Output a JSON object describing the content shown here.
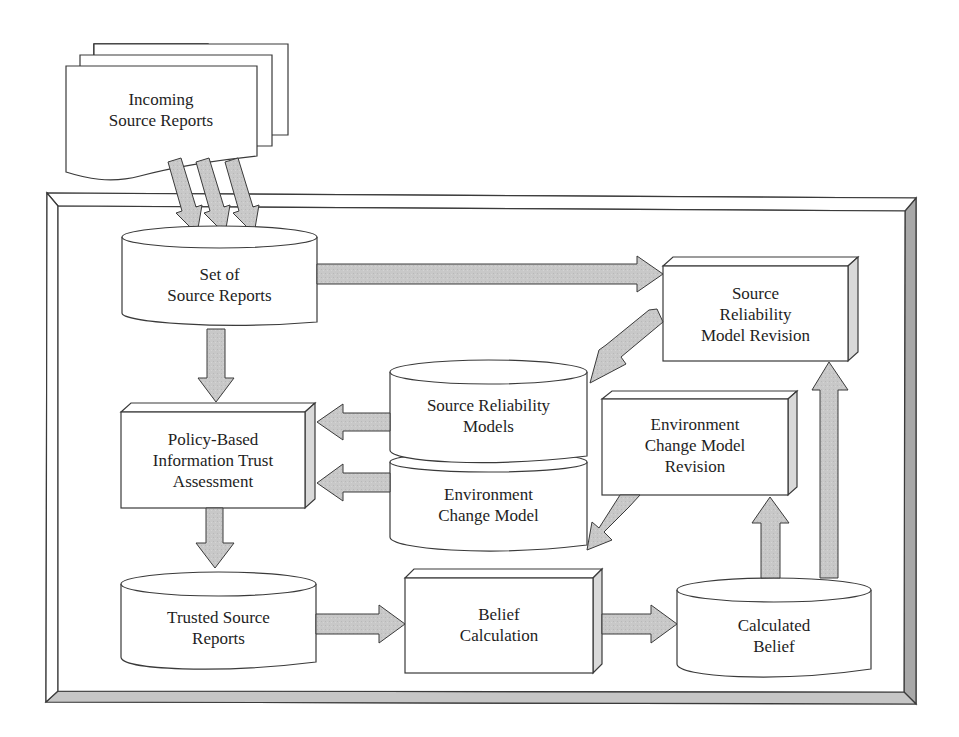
{
  "diagram": {
    "colors": {
      "stroke": "#3a3a3a",
      "arrow_fill": "#c8c8c8",
      "frame_shade": "#b4b4b4",
      "box_side": "#d9d9d9",
      "background": "#ffffff"
    },
    "nodes": {
      "incoming": {
        "type": "multi-document",
        "label": "Incoming\nSource Reports"
      },
      "set_reports": {
        "type": "datastore",
        "label": "Set of\nSource Reports"
      },
      "srm_revision": {
        "type": "process",
        "label": "Source\nReliability\nModel Revision"
      },
      "sr_models": {
        "type": "datastore",
        "label": "Source Reliability\nModels"
      },
      "env_model": {
        "type": "datastore",
        "label": "Environment\nChange Model"
      },
      "policy": {
        "type": "process",
        "label": "Policy-Based\nInformation Trust\nAssessment"
      },
      "env_revision": {
        "type": "process",
        "label": "Environment\nChange Model\nRevision"
      },
      "trusted": {
        "type": "datastore",
        "label": "Trusted Source\nReports"
      },
      "belief_calc": {
        "type": "process",
        "label": "Belief\nCalculation"
      },
      "calc_belief": {
        "type": "datastore",
        "label": "Calculated\nBelief"
      }
    },
    "edges": [
      {
        "from": "incoming",
        "to": "set_reports",
        "count": 3
      },
      {
        "from": "set_reports",
        "to": "srm_revision"
      },
      {
        "from": "set_reports",
        "to": "policy"
      },
      {
        "from": "srm_revision",
        "to": "sr_models"
      },
      {
        "from": "sr_models",
        "to": "policy"
      },
      {
        "from": "env_model",
        "to": "policy"
      },
      {
        "from": "env_revision",
        "to": "env_model"
      },
      {
        "from": "policy",
        "to": "trusted"
      },
      {
        "from": "trusted",
        "to": "belief_calc"
      },
      {
        "from": "belief_calc",
        "to": "calc_belief"
      },
      {
        "from": "calc_belief",
        "to": "env_revision"
      },
      {
        "from": "calc_belief",
        "to": "srm_revision"
      }
    ]
  }
}
